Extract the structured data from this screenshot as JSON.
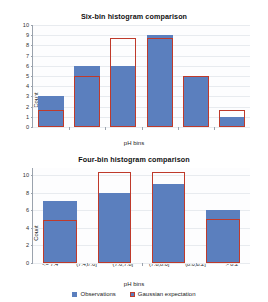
{
  "chart_data": [
    {
      "type": "bar",
      "title": "Six-bin histogram comparison",
      "xlabel": "pH bins",
      "ylabel": "Count",
      "ylim": [
        0,
        10
      ],
      "yticks": [
        0,
        1,
        2,
        3,
        4,
        5,
        6,
        7,
        8,
        9,
        10
      ],
      "grid": true,
      "legend_position": "below-bottom-panel",
      "categories": [
        "<= 7.4",
        "(7.4,7.6]",
        "(7.6,7.8]",
        "(7.8,8.0]",
        "(8.0,8.2]",
        "> 8.2"
      ],
      "series": [
        {
          "name": "Observations",
          "color": "#5b7fbe",
          "values": [
            3,
            6,
            6,
            9,
            5,
            1
          ]
        },
        {
          "name": "Gaussian expectation",
          "color": "#bf3a2b",
          "values": [
            1.7,
            5.0,
            8.7,
            8.7,
            5.0,
            1.7
          ]
        }
      ]
    },
    {
      "type": "bar",
      "title": "Four-bin histogram comparison",
      "xlabel": "pH bins",
      "ylabel": "Count",
      "ylim": [
        0,
        10.8
      ],
      "yticks": [
        0,
        2,
        4,
        6,
        8,
        10
      ],
      "grid": true,
      "legend_position": "bottom-center",
      "categories": [
        "< 7.55",
        "7.55 to 7.81",
        "7.81 to 8.08",
        "> 8.08"
      ],
      "series": [
        {
          "name": "Observations",
          "color": "#5b7fbe",
          "values": [
            7,
            8,
            9,
            6
          ]
        },
        {
          "name": "Gaussian expectation",
          "color": "#bf3a2b",
          "values": [
            4.9,
            10.3,
            10.3,
            5.0
          ]
        }
      ]
    }
  ],
  "legend": {
    "observations_label": "Observations",
    "expectation_label": "Gaussian expectation"
  },
  "colors": {
    "observations": "#5b7fbe",
    "expectation": "#bf3a2b",
    "grid": "#e8ebef",
    "axis": "#9aa2ad"
  }
}
